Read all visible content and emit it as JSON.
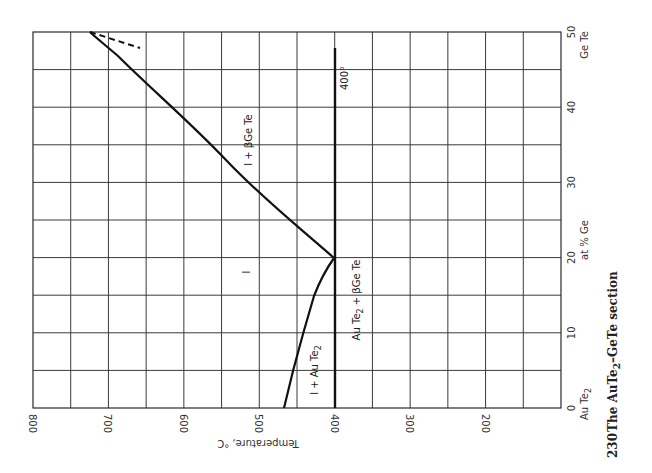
{
  "chart_data": {
    "type": "line",
    "title": "The AuTe2–GeTe section",
    "figure_number": "230",
    "orientation": "rotated 90° (temperature runs right-to-left along the horizontal, composition runs bottom-to-top along the vertical)",
    "xlabel": "at % Ge",
    "ylabel": "Temperature, °C",
    "x_axis": {
      "range": [
        0,
        50
      ],
      "ticks": [
        0,
        10,
        20,
        30,
        40,
        50
      ],
      "minor_gridlines": [
        5,
        15,
        25,
        35,
        45
      ],
      "endpoint_labels": {
        "left": "AuTe2",
        "right": "GeTe"
      }
    },
    "y_axis": {
      "range": [
        100,
        800
      ],
      "ticks": [
        800,
        700,
        600,
        500,
        400,
        300,
        200
      ],
      "gridline_step": 50
    },
    "grid": true,
    "series": [
      {
        "name": "AuTe2 liquidus",
        "style": "solid",
        "x": [
          0,
          5,
          10,
          15,
          18,
          20
        ],
        "y": [
          467,
          455,
          442,
          428,
          415,
          400
        ]
      },
      {
        "name": "GeTe liquidus",
        "style": "solid",
        "x": [
          20,
          25,
          30,
          35,
          40,
          45,
          50
        ],
        "y": [
          400,
          450,
          502,
          601,
          649,
          700,
          724
        ]
      },
      {
        "name": "GeTe solidus (dashed)",
        "style": "dashed",
        "x": [
          50,
          47.8
        ],
        "y": [
          724,
          657
        ]
      },
      {
        "name": "eutectic isotherm",
        "style": "solid-thick",
        "x": [
          0,
          48
        ],
        "y": [
          400,
          400
        ]
      }
    ],
    "annotations": [
      {
        "text": "l",
        "x": 15,
        "y": 507
      },
      {
        "text": "l + βGeTe",
        "x": 38,
        "y": 517
      },
      {
        "text": "l + AuTe2",
        "x": 5,
        "y": 430
      },
      {
        "text": "AuTe2 + βGeTe",
        "x": 15,
        "y": 375
      },
      {
        "text": "400°",
        "x": 44,
        "y": 390
      }
    ]
  },
  "labels": {
    "temp_ticks": [
      "800",
      "700",
      "600",
      "500",
      "400",
      "300",
      "200"
    ],
    "comp_ticks": [
      "0",
      "10",
      "20",
      "30",
      "40",
      "50"
    ],
    "left_end": "Au Te",
    "left_end_sub": "2",
    "right_end": "Ge Te",
    "x_title": "at % Ge",
    "y_title": "Temperature, °C",
    "region_l": "l",
    "region_l_gete": "l + βGe Te",
    "region_l_aute2": "l + Au Te",
    "region_l_aute2_sub": "2",
    "region_aute2_gete_a": "Au Te",
    "region_aute2_gete_sub": "2",
    "region_aute2_gete_b": " + βGe Te",
    "isotherm": "400°",
    "caption_number": "230",
    "caption_text": "The AuTe",
    "caption_sub": "2",
    "caption_rest": "–GeTe section"
  }
}
